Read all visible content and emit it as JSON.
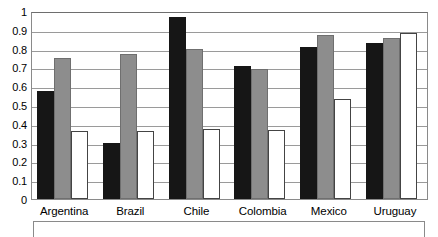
{
  "chart_data": {
    "type": "bar",
    "title": "",
    "subtitle": "",
    "xlabel": "",
    "ylabel": "",
    "categories": [
      "Argentina",
      "Brazil",
      "Chile",
      "Colombia",
      "Mexico",
      "Uruguay"
    ],
    "series": [
      {
        "name": "series-1",
        "color": "#161616",
        "values": [
          0.575,
          0.3,
          0.97,
          0.71,
          0.81,
          0.83
        ]
      },
      {
        "name": "series-2",
        "color": "#8d8d8d",
        "values": [
          0.75,
          0.77,
          0.8,
          0.69,
          0.87,
          0.855
        ]
      },
      {
        "name": "series-3",
        "color": "#ffffff",
        "values": [
          0.36,
          0.36,
          0.375,
          0.365,
          0.53,
          0.885
        ]
      }
    ],
    "ylim": [
      0,
      1
    ],
    "ytick_labels": [
      "1",
      "0.9",
      "0.8",
      "0.7",
      "0.6",
      "0.5",
      "0.4",
      "0.3",
      "0.2",
      "0.1",
      "0"
    ],
    "ytick_values": [
      1,
      0.9,
      0.8,
      0.7,
      0.6,
      0.5,
      0.4,
      0.3,
      0.2,
      0.1,
      0
    ],
    "grid": true,
    "legend_position": "bottom",
    "legend_entries": [],
    "annotations": []
  },
  "legend": {
    "label": ""
  }
}
